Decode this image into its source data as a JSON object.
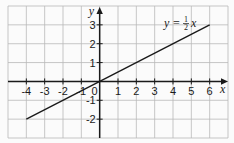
{
  "chart_data": {
    "type": "line",
    "title": "",
    "xlabel": "x",
    "ylabel": "y",
    "xlim": [
      -5,
      7
    ],
    "ylim": [
      -3,
      4
    ],
    "grid": true,
    "x_ticks": [
      -4,
      -3,
      -2,
      -1,
      0,
      1,
      2,
      3,
      4,
      5,
      6
    ],
    "y_ticks": [
      -2,
      -1,
      1,
      2,
      3
    ],
    "x_tick_labels": [
      "-4",
      "-3",
      "-2",
      "-1",
      "0",
      "1",
      "2",
      "3",
      "4",
      "5",
      "6"
    ],
    "y_tick_labels": [
      "-2",
      "-1",
      "1",
      "2",
      "3"
    ],
    "series": [
      {
        "name": "y = ½x",
        "x": [
          -4,
          6
        ],
        "y": [
          -2,
          3
        ]
      }
    ],
    "annotations": [
      {
        "text": "y = ½x",
        "x": 4.3,
        "y": 3.3
      }
    ]
  },
  "labels": {
    "x_axis": "x",
    "y_axis": "y",
    "origin": "0",
    "equation_prefix": "y =",
    "equation_num": "1",
    "equation_den": "2",
    "equation_var": "x"
  },
  "colors": {
    "grid": "#b9b9b9",
    "axis": "#1a1a1a",
    "line": "#1a1a1a",
    "background": "#fbfbfb"
  }
}
